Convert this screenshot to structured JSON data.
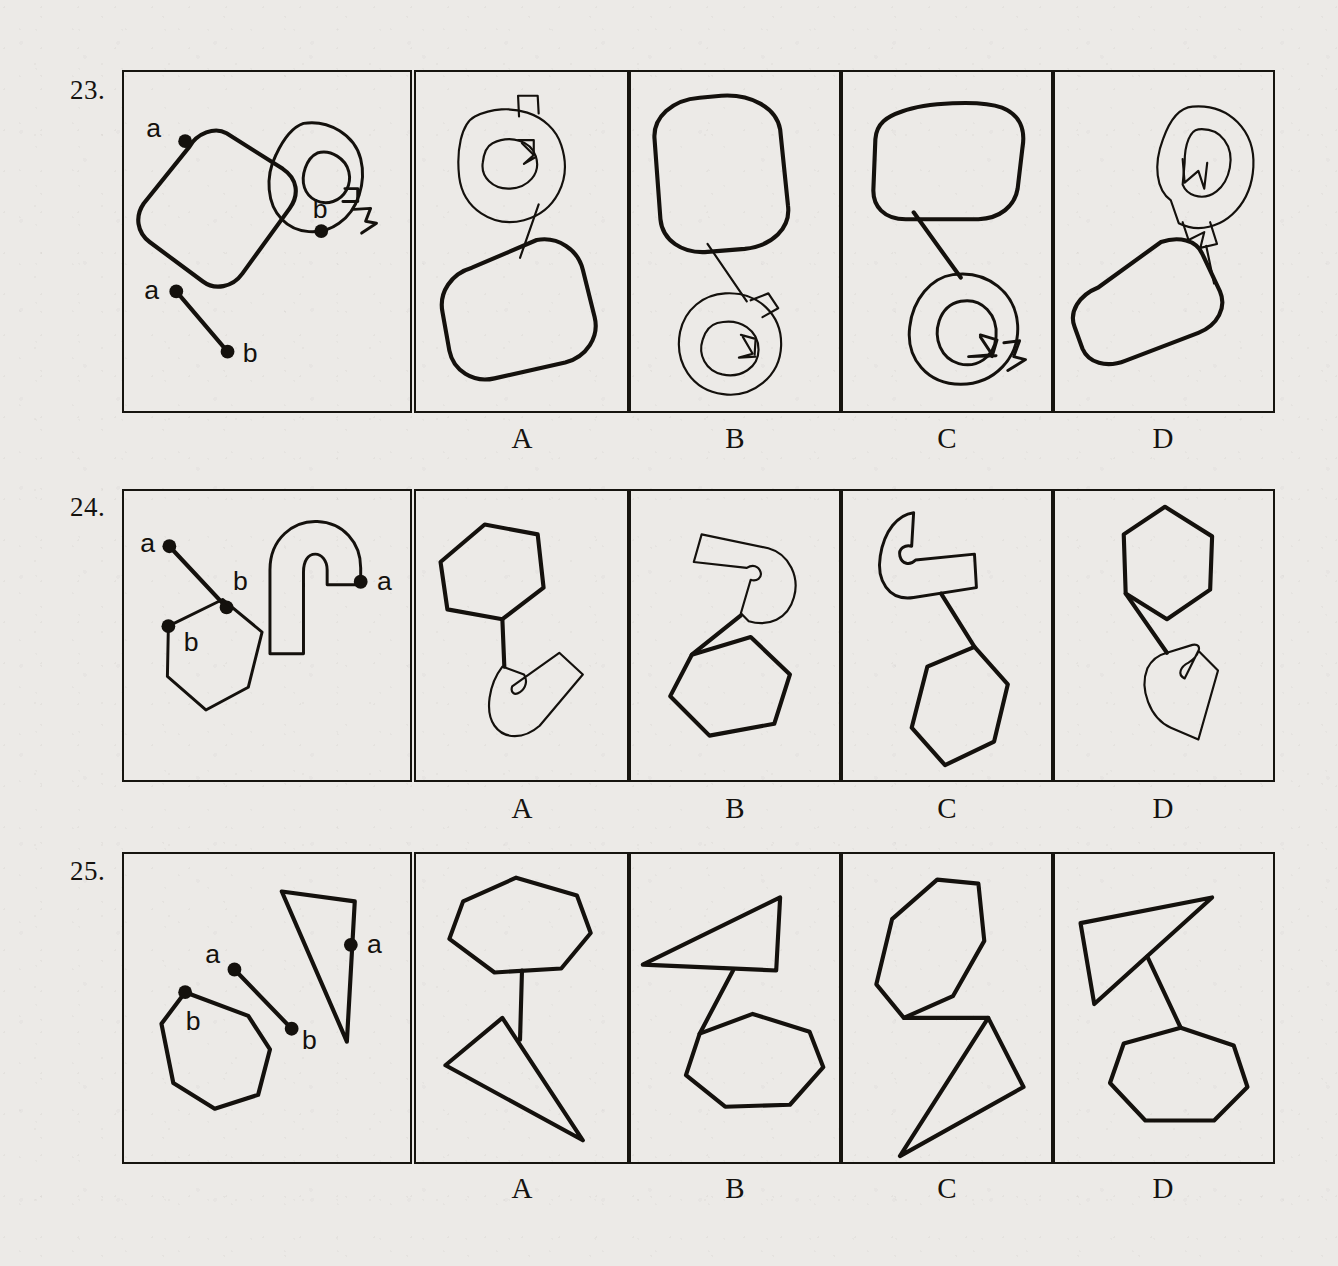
{
  "page": {
    "background_color": "#eceae7",
    "ink_color": "#14110d",
    "items": [
      {
        "number": "23.",
        "option_labels": [
          "A",
          "B",
          "C",
          "D"
        ],
        "prompt_point_labels": [
          "a",
          "b",
          "a",
          "b"
        ],
        "prompt_shapes": [
          "rounded-square",
          "letter-q-outline",
          "segment-ab"
        ]
      },
      {
        "number": "24.",
        "option_labels": [
          "A",
          "B",
          "C",
          "D"
        ],
        "prompt_point_labels": [
          "a",
          "b",
          "a",
          "b"
        ],
        "prompt_shapes": [
          "segment-ab",
          "hook-outline",
          "hexagon"
        ]
      },
      {
        "number": "25.",
        "option_labels": [
          "A",
          "B",
          "C",
          "D"
        ],
        "prompt_point_labels": [
          "a",
          "b",
          "a",
          "b"
        ],
        "prompt_shapes": [
          "thin-triangle",
          "segment-ab",
          "heptagon"
        ]
      }
    ]
  },
  "q23": {
    "number": "23.",
    "labels": {
      "a_top": "a",
      "b_right": "b",
      "a_left": "a",
      "b_low": "b"
    },
    "options": [
      {
        "id": "A",
        "label": "A"
      },
      {
        "id": "B",
        "label": "B"
      },
      {
        "id": "C",
        "label": "C"
      },
      {
        "id": "D",
        "label": "D"
      }
    ]
  },
  "q24": {
    "number": "24.",
    "labels": {
      "a_top": "a",
      "b_mid": "b",
      "a_right": "a",
      "b_left": "b"
    },
    "options": [
      {
        "id": "A",
        "label": "A"
      },
      {
        "id": "B",
        "label": "B"
      },
      {
        "id": "C",
        "label": "C"
      },
      {
        "id": "D",
        "label": "D"
      }
    ]
  },
  "q25": {
    "number": "25.",
    "labels": {
      "a_mid": "a",
      "b_mid": "b",
      "a_right": "a",
      "b_left": "b"
    },
    "options": [
      {
        "id": "A",
        "label": "A"
      },
      {
        "id": "B",
        "label": "B"
      },
      {
        "id": "C",
        "label": "C"
      },
      {
        "id": "D",
        "label": "D"
      }
    ]
  }
}
